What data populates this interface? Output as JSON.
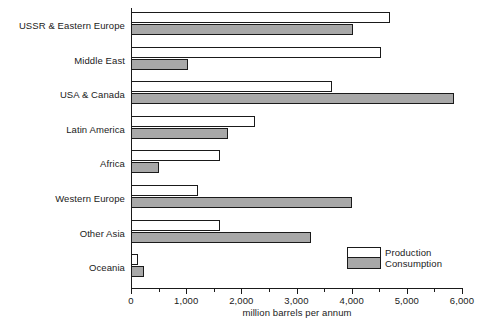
{
  "chart_data": {
    "type": "bar",
    "orientation": "horizontal",
    "title": "",
    "xlabel": "million barrels per annum",
    "ylabel": "",
    "xlim": [
      0,
      6000
    ],
    "xticks": [
      0,
      1000,
      2000,
      3000,
      4000,
      5000,
      6000
    ],
    "xticklabels": [
      "0",
      "1,000",
      "2,000",
      "3,000",
      "4,000",
      "5,000",
      "6,000"
    ],
    "minor_tick_interval": 500,
    "grid": false,
    "legend_position": "inside-bottom-right",
    "categories": [
      "USSR & Eastern Europe",
      "Middle East",
      "USA & Canada",
      "Latin America",
      "Africa",
      "Western Europe",
      "Other Asia",
      "Oceania"
    ],
    "series": [
      {
        "name": "Production",
        "color": "#ffffff",
        "values": [
          4700,
          4530,
          3650,
          2240,
          1610,
          1210,
          1610,
          130
        ]
      },
      {
        "name": "Consumption",
        "color": "#a8a8a8",
        "values": [
          4020,
          1030,
          5850,
          1750,
          500,
          4000,
          3270,
          240
        ]
      }
    ]
  },
  "legend": {
    "items": [
      {
        "label": "Production",
        "swatch": "white"
      },
      {
        "label": "Consumption",
        "swatch": "gray"
      }
    ]
  },
  "colors": {
    "axis": "#1a1a1a",
    "production_fill": "#ffffff",
    "consumption_fill": "#a8a8a8",
    "background": "#ffffff"
  }
}
